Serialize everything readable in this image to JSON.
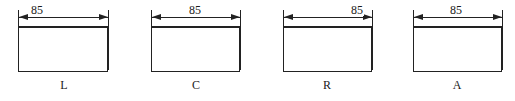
{
  "figures": [
    {
      "label": "L",
      "dimension": "85",
      "alignment": "left",
      "box_x": 18,
      "box_w": 90
    },
    {
      "label": "C",
      "dimension": "85",
      "alignment": "center",
      "box_x": 151,
      "box_w": 89
    },
    {
      "label": "R",
      "dimension": "85",
      "alignment": "right",
      "box_x": 283,
      "box_w": 89
    },
    {
      "label": "A",
      "dimension": "85",
      "alignment": "auto",
      "box_x": 413,
      "box_w": 89
    }
  ]
}
